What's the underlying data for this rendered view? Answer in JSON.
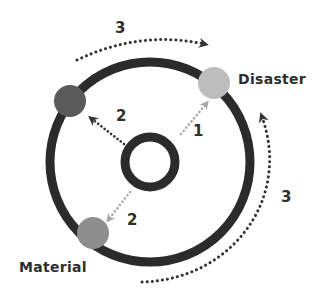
{
  "diagram": {
    "type": "cycle-diagram",
    "colors": {
      "ring": "#2b2b2b",
      "arrow_dark": "#333333",
      "arrow_light": "#a9a9a9",
      "node_dark": "#5a5a5a",
      "node_light": "#bdbdbd",
      "node_mid": "#8e8e8e",
      "text": "#2e2e2e"
    },
    "nodes": [
      {
        "id": "top-left",
        "label": "",
        "tone": "dark"
      },
      {
        "id": "disaster",
        "label": "Disaster",
        "tone": "light"
      },
      {
        "id": "material",
        "label": "Material",
        "tone": "mid"
      }
    ],
    "inner_arrows": [
      {
        "to": "disaster",
        "label": "1"
      },
      {
        "to": "top-left",
        "label": "2"
      },
      {
        "to": "material",
        "label": "2"
      }
    ],
    "outer_arrows": [
      {
        "from": "top-left",
        "to": "disaster",
        "label": "3",
        "direction": "clockwise"
      },
      {
        "from": "material",
        "to": "disaster",
        "label": "3",
        "direction": "counter-clockwise"
      }
    ]
  }
}
